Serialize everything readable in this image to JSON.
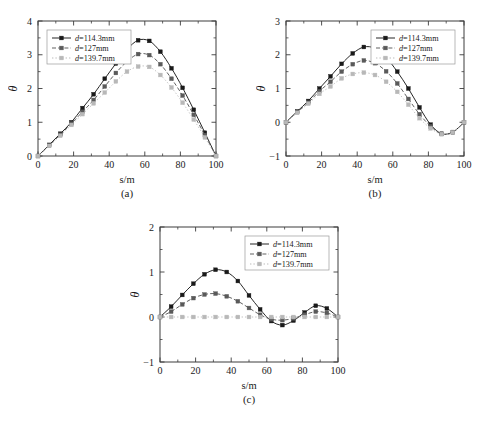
{
  "figure": {
    "background": "#ffffff",
    "series_colors": {
      "d114": "#1a1a1a",
      "d127": "#5a5a5a",
      "d139": "#b8b8b8"
    },
    "axis_color": "#3c3c3c"
  },
  "legend": {
    "entries": [
      {
        "key": "d114",
        "label": "d=114.3mm",
        "marker": "square-filled",
        "line": "solid"
      },
      {
        "key": "d127",
        "label": "d=127mm",
        "marker": "square-filled",
        "line": "dashed"
      },
      {
        "key": "d139",
        "label": "d=139.7mm",
        "marker": "square-filled",
        "line": "dotted"
      }
    ]
  },
  "chart_data": [
    {
      "id": "a",
      "type": "line",
      "caption": "(a)",
      "title": "",
      "xlabel": "s/m",
      "ylabel": "θ",
      "xlim": [
        0,
        100
      ],
      "ylim": [
        0,
        4
      ],
      "xticks": [
        0,
        20,
        40,
        60,
        80,
        100
      ],
      "yticks": [
        0,
        1,
        2,
        3,
        4
      ],
      "grid": false,
      "legend_position": "top-left",
      "x": [
        0,
        6.25,
        12.5,
        18.75,
        25,
        31.25,
        37.5,
        43.75,
        50,
        56.25,
        62.5,
        68.75,
        75,
        81.25,
        87.5,
        93.75,
        100
      ],
      "series": [
        {
          "name": "d=114.3mm",
          "key": "d114",
          "values": [
            0.0,
            0.33,
            0.66,
            1.0,
            1.42,
            1.83,
            2.29,
            2.74,
            3.16,
            3.43,
            3.41,
            3.09,
            2.6,
            2.02,
            1.37,
            0.69,
            0.0
          ]
        },
        {
          "name": "d=127mm",
          "key": "d127",
          "values": [
            0.0,
            0.31,
            0.63,
            0.96,
            1.31,
            1.66,
            2.06,
            2.46,
            2.8,
            3.02,
            2.99,
            2.72,
            2.29,
            1.79,
            1.22,
            0.62,
            0.0
          ]
        },
        {
          "name": "d=139.7mm",
          "key": "d139",
          "values": [
            0.0,
            0.3,
            0.6,
            0.92,
            1.24,
            1.56,
            1.88,
            2.21,
            2.5,
            2.65,
            2.64,
            2.4,
            2.03,
            1.58,
            1.08,
            0.55,
            0.0
          ]
        }
      ]
    },
    {
      "id": "b",
      "type": "line",
      "caption": "(b)",
      "title": "",
      "xlabel": "s/m",
      "ylabel": "θ",
      "xlim": [
        0,
        100
      ],
      "ylim": [
        -1,
        3
      ],
      "xticks": [
        0,
        20,
        40,
        60,
        80,
        100
      ],
      "yticks": [
        -1,
        0,
        1,
        2,
        3
      ],
      "grid": false,
      "legend_position": "top-right",
      "x": [
        0,
        6.25,
        12.5,
        18.75,
        25,
        31.25,
        37.5,
        43.75,
        50,
        56.25,
        62.5,
        68.75,
        75,
        81.25,
        87.5,
        93.75,
        100
      ],
      "series": [
        {
          "name": "d=114.3mm",
          "key": "d114",
          "values": [
            0.0,
            0.32,
            0.63,
            1.0,
            1.36,
            1.73,
            2.04,
            2.23,
            2.19,
            1.92,
            1.5,
            1.0,
            0.44,
            -0.07,
            -0.34,
            -0.29,
            0.0
          ]
        },
        {
          "name": "d=127mm",
          "key": "d127",
          "values": [
            0.0,
            0.3,
            0.58,
            0.92,
            1.2,
            1.5,
            1.72,
            1.83,
            1.75,
            1.51,
            1.15,
            0.69,
            0.24,
            -0.12,
            -0.35,
            -0.3,
            0.0
          ]
        },
        {
          "name": "d=139.7mm",
          "key": "d139",
          "values": [
            0.0,
            0.28,
            0.55,
            0.84,
            1.06,
            1.3,
            1.43,
            1.47,
            1.4,
            1.2,
            0.9,
            0.52,
            0.12,
            -0.18,
            -0.35,
            -0.3,
            0.0
          ]
        }
      ]
    },
    {
      "id": "c",
      "type": "line",
      "caption": "(c)",
      "title": "",
      "xlabel": "s/m",
      "ylabel": "θ",
      "xlim": [
        0,
        100
      ],
      "ylim": [
        -1,
        2
      ],
      "xticks": [
        0,
        20,
        40,
        60,
        80,
        100
      ],
      "yticks": [
        -1,
        0,
        1,
        2
      ],
      "grid": false,
      "legend_position": "top-right",
      "x": [
        0,
        6.25,
        12.5,
        18.75,
        25,
        31.25,
        37.5,
        43.75,
        50,
        56.25,
        62.5,
        68.75,
        75,
        81.25,
        87.5,
        93.75,
        100
      ],
      "series": [
        {
          "name": "d=114.3mm",
          "key": "d114",
          "values": [
            0.0,
            0.23,
            0.49,
            0.74,
            0.95,
            1.05,
            1.0,
            0.8,
            0.48,
            0.17,
            -0.09,
            -0.18,
            -0.08,
            0.1,
            0.25,
            0.19,
            0.0
          ]
        },
        {
          "name": "d=127mm",
          "key": "d127",
          "values": [
            0.0,
            0.12,
            0.28,
            0.42,
            0.5,
            0.52,
            0.46,
            0.35,
            0.2,
            0.05,
            -0.05,
            -0.07,
            -0.03,
            0.05,
            0.12,
            0.09,
            0.0
          ]
        },
        {
          "name": "d=139.7mm",
          "key": "d139",
          "values": [
            0.0,
            0.0,
            0.0,
            0.0,
            0.0,
            0.0,
            0.0,
            0.0,
            0.0,
            0.0,
            0.0,
            0.0,
            0.0,
            0.0,
            0.0,
            0.0,
            0.0
          ]
        }
      ]
    }
  ]
}
